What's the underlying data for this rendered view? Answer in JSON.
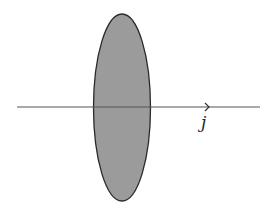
{
  "diagram": {
    "ellipse": {
      "cx": 122,
      "cy": 107.5,
      "rx": 28.5,
      "ry": 93.5,
      "fill": "#9b9b9b",
      "stroke": "#2a2a2a"
    },
    "axis": {
      "x1": 17,
      "x2": 260,
      "y": 107,
      "color": "#555555",
      "arrow_x": 209
    },
    "label": {
      "text": "j",
      "x": 201,
      "y": 112
    }
  }
}
